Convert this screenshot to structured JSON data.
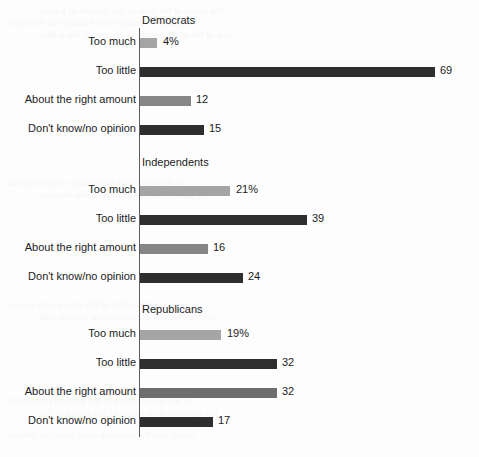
{
  "chart_data": {
    "type": "bar",
    "title": "",
    "subtitle": "",
    "xlabel": "",
    "ylabel": "",
    "orientation": "horizontal",
    "grid": false,
    "legend_position": "none",
    "xlim": [
      0,
      69
    ],
    "categories": [
      "Too much",
      "Too little",
      "About the right amount",
      "Don't know/no opinion"
    ],
    "groups": [
      {
        "name": "Democrats",
        "values": [
          4,
          69,
          12,
          15
        ],
        "value_labels": [
          "4%",
          "69",
          "12",
          "15"
        ],
        "bar_colors": [
          "#a5a5a5",
          "#2e2e2e",
          "#868686",
          "#2e2e2e"
        ]
      },
      {
        "name": "Independents",
        "values": [
          21,
          39,
          16,
          24
        ],
        "value_labels": [
          "21%",
          "39",
          "16",
          "24"
        ],
        "bar_colors": [
          "#a5a5a5",
          "#2e2e2e",
          "#868686",
          "#2e2e2e"
        ]
      },
      {
        "name": "Republicans",
        "values": [
          19,
          32,
          32,
          17
        ],
        "value_labels": [
          "19%",
          "32",
          "32",
          "17"
        ],
        "bar_colors": [
          "#a5a5a5",
          "#2e2e2e",
          "#6e6e6e",
          "#2e2e2e"
        ]
      }
    ],
    "colors": {
      "light_gray": "#a5a5a5",
      "medium_gray": "#6e6e6e",
      "dark": "#2e2e2e",
      "axis": "#5c5c5c",
      "text": "#1c1c1c",
      "background": "#fdfdfd"
    }
  },
  "background_bleed": [
    "the same of the year in the second of a time",
    "a matter of course in the parties of the other",
    "one of the most people in an overall the public",
    "of the state was the number of the most of",
    "the public and the country in the election",
    "it was a great deal of the time in the survey",
    "and the results of the national opinion poll",
    "of the respondents in the general population",
    "the question was asked of the adults in the",
    "study and the answers were given as follows"
  ]
}
